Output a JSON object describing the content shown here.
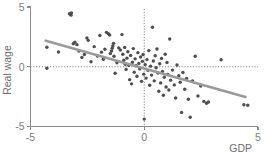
{
  "chart_data": {
    "type": "scatter",
    "title": "",
    "subtitle": "",
    "xlabel": "GDP",
    "ylabel": "Real wage",
    "xlim": [
      -5,
      5
    ],
    "ylim": [
      -5,
      5
    ],
    "xticks": [
      -5,
      0,
      5
    ],
    "yticks": [
      -5,
      0,
      5
    ],
    "xtick_labels": [
      "-5",
      "0",
      "5"
    ],
    "ytick_labels": [
      "-5",
      "0",
      "5"
    ],
    "grid": false,
    "legend": null,
    "legend_position": "none",
    "reference_lines": [
      {
        "name": "zero-vertical",
        "orientation": "vertical",
        "value": 0,
        "style": "dotted"
      },
      {
        "name": "zero-horizontal",
        "orientation": "horizontal",
        "value": 0,
        "style": "dotted"
      }
    ],
    "colors": {
      "point": "#4d4d4d",
      "fit_line": "#9a9a9a",
      "axis": "#8a8a8a",
      "reference_line": "#6f6f6f",
      "text": "#6d6d6d",
      "background": "#ffffff"
    },
    "fit_line": {
      "name": "linear-regression",
      "x_start": -4.33,
      "y_start": 2.18,
      "x_end": 4.45,
      "y_end": -2.53,
      "slope": -0.54,
      "intercept": -0.16,
      "correlation": "negative"
    },
    "point_count": 112,
    "points": [
      [
        -4.28,
        1.63
      ],
      [
        -4.28,
        -0.12
      ],
      [
        -3.77,
        1.23
      ],
      [
        -3.29,
        4.44
      ],
      [
        -3.2,
        4.5
      ],
      [
        -3.22,
        4.32
      ],
      [
        -3.12,
        1.92
      ],
      [
        -3.05,
        2.05
      ],
      [
        -2.96,
        1.85
      ],
      [
        -2.87,
        1.31
      ],
      [
        -2.74,
        0.78
      ],
      [
        -2.63,
        1.03
      ],
      [
        -2.52,
        2.4
      ],
      [
        -2.46,
        2.21
      ],
      [
        -2.34,
        0.42
      ],
      [
        -2.2,
        1.68
      ],
      [
        -2.06,
        0.9
      ],
      [
        -1.95,
        2.61
      ],
      [
        -1.88,
        1.22
      ],
      [
        -1.8,
        0.63
      ],
      [
        -1.73,
        1.47
      ],
      [
        -1.66,
        2.88
      ],
      [
        -1.58,
        2.76
      ],
      [
        -1.52,
        2.66
      ],
      [
        -1.49,
        1.1
      ],
      [
        -1.44,
        1.32
      ],
      [
        -1.41,
        1.55
      ],
      [
        -1.38,
        1.74
      ],
      [
        -1.35,
        1.96
      ],
      [
        -1.33,
        0.88
      ],
      [
        -1.28,
        -0.55
      ],
      [
        -1.2,
        0.33
      ],
      [
        -1.12,
        1.58
      ],
      [
        -1.05,
        1.4
      ],
      [
        -0.98,
        2.69
      ],
      [
        -0.94,
        1.05
      ],
      [
        -0.9,
        0.54
      ],
      [
        -0.86,
        1.62
      ],
      [
        -0.83,
        0.2
      ],
      [
        -0.8,
        -0.22
      ],
      [
        -0.76,
        0.72
      ],
      [
        -0.72,
        1.25
      ],
      [
        -0.68,
        0.12
      ],
      [
        -0.64,
        -1.08
      ],
      [
        -0.6,
        0.95
      ],
      [
        -0.56,
        -1.43
      ],
      [
        -0.52,
        0.38
      ],
      [
        -0.48,
        1.52
      ],
      [
        -0.44,
        -0.45
      ],
      [
        -0.4,
        0.66
      ],
      [
        -0.36,
        0.08
      ],
      [
        -0.32,
        -0.8
      ],
      [
        -0.28,
        1.18
      ],
      [
        -0.24,
        0.28
      ],
      [
        -0.2,
        -0.18
      ],
      [
        -0.16,
        0.82
      ],
      [
        -0.12,
        -1.22
      ],
      [
        -0.08,
        0.45
      ],
      [
        -0.05,
        1.02
      ],
      [
        -0.02,
        -0.62
      ],
      [
        0.0,
        -4.38
      ],
      [
        0.04,
        0.18
      ],
      [
        0.08,
        -0.95
      ],
      [
        0.12,
        0.6
      ],
      [
        0.16,
        -0.3
      ],
      [
        0.2,
        1.35
      ],
      [
        0.24,
        -1.55
      ],
      [
        0.28,
        0.05
      ],
      [
        0.32,
        -0.7
      ],
      [
        0.36,
        3.3
      ],
      [
        0.4,
        0.48
      ],
      [
        0.44,
        -1.18
      ],
      [
        0.48,
        0.92
      ],
      [
        0.52,
        -0.08
      ],
      [
        0.56,
        1.48
      ],
      [
        0.6,
        -0.52
      ],
      [
        0.64,
        -2.05
      ],
      [
        0.68,
        0.25
      ],
      [
        0.72,
        -1.35
      ],
      [
        0.76,
        0.7
      ],
      [
        0.8,
        -0.4
      ],
      [
        0.84,
        -2.38
      ],
      [
        0.88,
        -0.88
      ],
      [
        0.92,
        1.05
      ],
      [
        0.96,
        -1.7
      ],
      [
        1.0,
        0.35
      ],
      [
        1.04,
        -0.65
      ],
      [
        1.08,
        -1.95
      ],
      [
        1.12,
        2.32
      ],
      [
        1.16,
        -1.12
      ],
      [
        1.24,
        -0.28
      ],
      [
        1.32,
        -1.52
      ],
      [
        1.38,
        -2.62
      ],
      [
        1.44,
        0.15
      ],
      [
        1.52,
        -0.75
      ],
      [
        1.58,
        -1.3
      ],
      [
        1.64,
        -3.82
      ],
      [
        1.7,
        -0.48
      ],
      [
        1.78,
        -1.88
      ],
      [
        1.86,
        -0.98
      ],
      [
        1.94,
        -2.72
      ],
      [
        2.02,
        -4.22
      ],
      [
        2.12,
        -1.18
      ],
      [
        2.24,
        0.88
      ],
      [
        2.36,
        -2.45
      ],
      [
        2.48,
        -1.62
      ],
      [
        2.62,
        -2.9
      ],
      [
        2.74,
        -3.05
      ],
      [
        2.82,
        -2.95
      ],
      [
        3.38,
        0.58
      ],
      [
        4.38,
        -3.18
      ],
      [
        4.55,
        -3.22
      ]
    ]
  },
  "axis": {
    "y_title": "Real wage",
    "x_title": "GDP"
  }
}
